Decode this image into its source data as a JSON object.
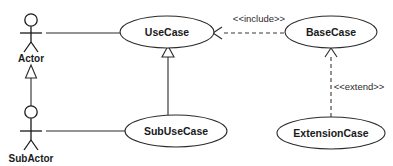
{
  "diagram": {
    "kind": "uml-use-case-diagram",
    "background_color": "#ffffff",
    "line_color": "#2b2b2b",
    "text_color": "#1a1a1a",
    "actors": [
      {
        "id": "actor",
        "label": "Actor",
        "x": 31,
        "y": 33,
        "label_y": 57
      },
      {
        "id": "subactor",
        "label": "SubActor",
        "x": 31,
        "y": 125,
        "label_y": 161
      }
    ],
    "use_cases": [
      {
        "id": "usecase",
        "label": "UseCase",
        "cx": 167,
        "cy": 32,
        "rx": 47,
        "ry": 16
      },
      {
        "id": "basecase",
        "label": "BaseCase",
        "cx": 331,
        "cy": 32,
        "rx": 46,
        "ry": 16
      },
      {
        "id": "subusecase",
        "label": "SubUseCase",
        "cx": 176,
        "cy": 131,
        "rx": 51,
        "ry": 16
      },
      {
        "id": "extensioncase",
        "label": "ExtensionCase",
        "cx": 331,
        "cy": 133,
        "rx": 54,
        "ry": 16
      }
    ],
    "relationships": [
      {
        "id": "actor-usecase-association",
        "type": "association",
        "from": "actor",
        "to": "usecase",
        "stereotype": ""
      },
      {
        "id": "subactor-subusecase-association",
        "type": "association",
        "from": "subactor",
        "to": "subusecase",
        "stereotype": ""
      },
      {
        "id": "subactor-actor-generalization",
        "type": "generalization",
        "from": "subactor",
        "to": "actor",
        "stereotype": ""
      },
      {
        "id": "subusecase-usecase-generalization",
        "type": "generalization",
        "from": "subusecase",
        "to": "usecase",
        "stereotype": ""
      },
      {
        "id": "basecase-usecase-include",
        "type": "dependency",
        "from": "basecase",
        "to": "usecase",
        "stereotype": "<<include>>",
        "label_x": 259,
        "label_y": 22
      },
      {
        "id": "extensioncase-basecase-extend",
        "type": "dependency",
        "from": "extensioncase",
        "to": "basecase",
        "stereotype": "<<extend>>",
        "label_x": 359,
        "label_y": 87
      }
    ]
  }
}
